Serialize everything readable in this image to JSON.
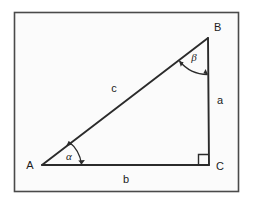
{
  "figure": {
    "background_color": "#fbfbfb",
    "frame_color": "#4a4a4a",
    "line_color": "#2b2b2b",
    "text_color": "#1c1c1c"
  },
  "vertices": [
    {
      "id": "A",
      "label": "A",
      "x": 42,
      "y": 165,
      "label_x": 30,
      "label_y": 169
    },
    {
      "id": "B",
      "label": "B",
      "x": 208,
      "y": 38,
      "label_x": 214,
      "label_y": 31
    },
    {
      "id": "C",
      "label": "C",
      "x": 209,
      "y": 165,
      "label_x": 216,
      "label_y": 170
    }
  ],
  "sides": [
    {
      "id": "a",
      "label": "a",
      "from": "B",
      "to": "C",
      "label_x": 217,
      "label_y": 104
    },
    {
      "id": "b",
      "label": "b",
      "from": "A",
      "to": "C",
      "label_x": 126,
      "label_y": 183
    },
    {
      "id": "c",
      "label": "c",
      "from": "A",
      "to": "B",
      "label_x": 114,
      "label_y": 92
    }
  ],
  "angles": [
    {
      "id": "alpha",
      "label": "α",
      "at": "A",
      "label_x": 69,
      "label_y": 160
    },
    {
      "id": "beta",
      "label": "β",
      "at": "B",
      "label_x": 194,
      "label_y": 61
    }
  ],
  "markers": [
    {
      "id": "right-angle-C",
      "type": "right-angle-square",
      "at": "C"
    }
  ]
}
